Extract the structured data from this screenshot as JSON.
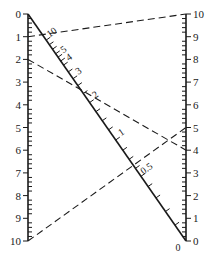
{
  "diagram": {
    "type": "nomogram",
    "left_scale": {
      "name": "left-scale",
      "min": 0,
      "max": 10,
      "direction": "top-to-bottom",
      "labels": [
        "0",
        "1",
        "2",
        "3",
        "4",
        "5",
        "6",
        "7",
        "8",
        "9",
        "10"
      ],
      "minor_divisions": 5
    },
    "right_scale": {
      "name": "right-scale",
      "min": 0,
      "max": 10,
      "direction": "bottom-to-top",
      "labels": [
        "0",
        "1",
        "2",
        "3",
        "4",
        "5",
        "6",
        "7",
        "8",
        "9",
        "10"
      ],
      "minor_divisions": 5
    },
    "diagonal_scale": {
      "name": "diagonal-scale",
      "labels": [
        {
          "text": "10",
          "t": 0.115
        },
        {
          "text": "5",
          "t": 0.19
        },
        {
          "text": "4",
          "t": 0.225
        },
        {
          "text": "3",
          "t": 0.285
        },
        {
          "text": "2",
          "t": 0.39
        },
        {
          "text": "1",
          "t": 0.555
        },
        {
          "text": "0.5",
          "t": 0.715
        },
        {
          "text": "0",
          "t": 1.0
        }
      ],
      "tick_t": [
        0.115,
        0.135,
        0.155,
        0.175,
        0.19,
        0.207,
        0.225,
        0.255,
        0.285,
        0.315,
        0.35,
        0.39,
        0.43,
        0.47,
        0.51,
        0.555,
        0.6,
        0.64,
        0.68,
        0.715,
        0.76,
        0.81,
        0.87,
        0.93
      ]
    },
    "isopleths": [
      {
        "name": "isopleth-1",
        "left_value": 1,
        "right_value": 10
      },
      {
        "name": "isopleth-2",
        "left_value": 2,
        "right_value": 4
      },
      {
        "name": "isopleth-3",
        "left_value": 10,
        "right_value": 5
      }
    ]
  }
}
